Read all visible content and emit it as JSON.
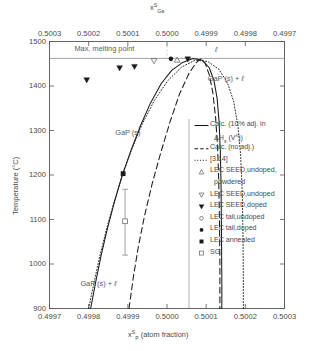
{
  "chart_data": {
    "type": "line",
    "title": "",
    "xlabel": "x_P^S (atom fraction)",
    "xlabel_base": "x",
    "xlabel_sub": "P",
    "xlabel_sup": "S",
    "xlabel_rest": " (atom  fraction)",
    "ylabel": "Temperature (°C)",
    "top_axis_label_base": "x",
    "top_axis_label_sub": "Ga",
    "top_axis_label_sup": "S",
    "xlim": [
      0.4997,
      0.5003
    ],
    "ylim": [
      900,
      1500
    ],
    "xticks": [
      "0.4997",
      "0.4998",
      "0.4999",
      "0.5000",
      "0.5001",
      "0.5002",
      "0.5003"
    ],
    "xticks_top": [
      "0.5003",
      "0.5002",
      "0.5001",
      "0.5000",
      "0.4999",
      "0.4998",
      "0.4997"
    ],
    "yticks": [
      "900",
      "1000",
      "1100",
      "1200",
      "1300",
      "1400",
      "1500"
    ],
    "grid": false,
    "max_melting_point_T": 1462,
    "annotations": [
      {
        "name": "max-melting-point",
        "text": "Max. melting point",
        "x": 0.49983,
        "y": 1483
      },
      {
        "name": "liquid-field",
        "text": "ℓ",
        "x": 0.50013,
        "y": 1480
      },
      {
        "name": "gap-solid-plus-liquid-right",
        "text": "GaP (s) + ℓ",
        "x": 0.50015,
        "y": 1415
      },
      {
        "name": "gap-solid",
        "text": "GaP (s)",
        "x": 0.4999,
        "y": 1295
      },
      {
        "name": "gap-solid-plus-liquid-left",
        "text": "GaP (s) + ℓ",
        "x": 0.499825,
        "y": 955
      }
    ],
    "series": [
      {
        "name": "Calc. (10% adj. in ΔHs (Vˣ))",
        "style": "solid",
        "points": [
          [
            0.499805,
            900
          ],
          [
            0.499818,
            960
          ],
          [
            0.499832,
            1020
          ],
          [
            0.499848,
            1080
          ],
          [
            0.499866,
            1140
          ],
          [
            0.499886,
            1200
          ],
          [
            0.499908,
            1255
          ],
          [
            0.499932,
            1310
          ],
          [
            0.499958,
            1362
          ],
          [
            0.499985,
            1405
          ],
          [
            0.500012,
            1435
          ],
          [
            0.50004,
            1453
          ],
          [
            0.500066,
            1462
          ],
          [
            0.50009,
            1458
          ],
          [
            0.500108,
            1441
          ],
          [
            0.50012,
            1412
          ],
          [
            0.500128,
            1372
          ],
          [
            0.500133,
            1320
          ],
          [
            0.500136,
            1255
          ],
          [
            0.500138,
            1180
          ],
          [
            0.500139,
            1080
          ],
          [
            0.50014,
            960
          ],
          [
            0.50014,
            900
          ]
        ]
      },
      {
        "name": "Calc. (no adj.)",
        "style": "dashed",
        "points": [
          [
            0.499903,
            900
          ],
          [
            0.499914,
            970
          ],
          [
            0.499927,
            1040
          ],
          [
            0.499943,
            1110
          ],
          [
            0.499962,
            1180
          ],
          [
            0.499984,
            1250
          ],
          [
            0.500008,
            1320
          ],
          [
            0.500032,
            1382
          ],
          [
            0.500056,
            1428
          ],
          [
            0.500074,
            1452
          ],
          [
            0.500086,
            1461
          ],
          [
            0.500097,
            1452
          ],
          [
            0.500108,
            1425
          ],
          [
            0.500117,
            1385
          ],
          [
            0.500124,
            1330
          ],
          [
            0.500129,
            1265
          ],
          [
            0.500132,
            1190
          ],
          [
            0.500134,
            1100
          ],
          [
            0.500135,
            1000
          ],
          [
            0.500135,
            900
          ]
        ]
      },
      {
        "name": "[3.14]",
        "style": "dotted",
        "points": [
          [
            0.4998,
            900
          ],
          [
            0.499814,
            960
          ],
          [
            0.499829,
            1020
          ],
          [
            0.499846,
            1080
          ],
          [
            0.499865,
            1140
          ],
          [
            0.499886,
            1200
          ],
          [
            0.49991,
            1258
          ],
          [
            0.499937,
            1315
          ],
          [
            0.499968,
            1368
          ],
          [
            0.500002,
            1412
          ],
          [
            0.500038,
            1443
          ],
          [
            0.500072,
            1458
          ],
          [
            0.500104,
            1455
          ],
          [
            0.500132,
            1438
          ],
          [
            0.500154,
            1408
          ],
          [
            0.50017,
            1366
          ],
          [
            0.500181,
            1312
          ],
          [
            0.500188,
            1245
          ],
          [
            0.500192,
            1165
          ],
          [
            0.500194,
            1065
          ],
          [
            0.500195,
            965
          ],
          [
            0.500195,
            900
          ]
        ]
      }
    ],
    "data_points": [
      {
        "series": "LEC SEED, doped",
        "marker": "filled-triangle-down",
        "x": 0.499795,
        "y": 1413
      },
      {
        "series": "LEC SEED, doped",
        "marker": "filled-triangle-down",
        "x": 0.499879,
        "y": 1440
      },
      {
        "series": "LEC SEED, doped",
        "marker": "filled-triangle-down",
        "x": 0.499917,
        "y": 1443
      },
      {
        "series": "LEC SEED, undoped",
        "marker": "open-triangle-down",
        "x": 0.499967,
        "y": 1456
      },
      {
        "series": "LEC SEED, doped",
        "marker": "filled-triangle-down",
        "x": 0.500053,
        "y": 1460
      },
      {
        "series": "LEC SEED, undoped, powdered",
        "marker": "open-triangle-up",
        "x": 0.500026,
        "y": 1459
      },
      {
        "series": "LEC tail, doped",
        "marker": "filled-circle",
        "x": 0.50001,
        "y": 1461
      },
      {
        "series": "LEC annealed",
        "marker": "filled-square",
        "x": 0.499888,
        "y": 1203
      },
      {
        "series": "SG",
        "marker": "open-square",
        "x": 0.499893,
        "y": 1096,
        "yerr_low": 1020,
        "yerr_high": 1168
      }
    ],
    "legend": {
      "position": "right-inside",
      "entries": [
        {
          "label": "Calc. (10% adj. in",
          "label2": "ΔHs (Vˣ))",
          "marker": "line-solid",
          "name": "legend-calc-adjusted"
        },
        {
          "label": "Calc. (no adj.)",
          "marker": "line-dashed",
          "name": "legend-calc-no-adj"
        },
        {
          "label": "[3.14]",
          "marker": "line-dotted",
          "name": "legend-ref-314"
        },
        {
          "label": "LEC  SEED,undoped,",
          "label2": "powdered",
          "marker": "open-triangle-up",
          "name": "legend-lec-seed-undoped-powdered"
        },
        {
          "label": "LEC  SEED,undoped",
          "marker": "open-triangle-down",
          "name": "legend-lec-seed-undoped"
        },
        {
          "label": "LEC  SEED,doped",
          "marker": "filled-triangle-down",
          "name": "legend-lec-seed-doped"
        },
        {
          "label": "LEC  tail,undoped",
          "marker": "open-circle",
          "name": "legend-lec-tail-undoped"
        },
        {
          "label": "LEC  tail,doped",
          "marker": "filled-circle",
          "name": "legend-lec-tail-doped"
        },
        {
          "label": "LEC  annealed",
          "marker": "filled-square",
          "name": "legend-lec-annealed"
        },
        {
          "label": "SG",
          "marker": "open-square",
          "name": "legend-sg"
        }
      ]
    },
    "colors": {
      "axis": "#555555",
      "curve": "#1a1a1a",
      "text": "#4a4a4a",
      "background": "#ffffff"
    }
  }
}
